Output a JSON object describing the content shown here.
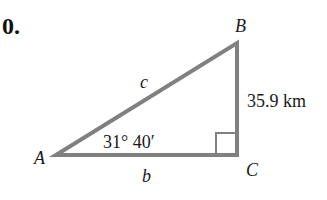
{
  "problem_number": "0.",
  "triangle": {
    "vertices": {
      "A": "A",
      "B": "B",
      "C": "C"
    },
    "sides": {
      "hypotenuse": "c",
      "base": "b",
      "vertical": "35.9 km"
    },
    "angle_A": "31° 40′",
    "right_angle_at": "C",
    "line_color": "#808080"
  }
}
